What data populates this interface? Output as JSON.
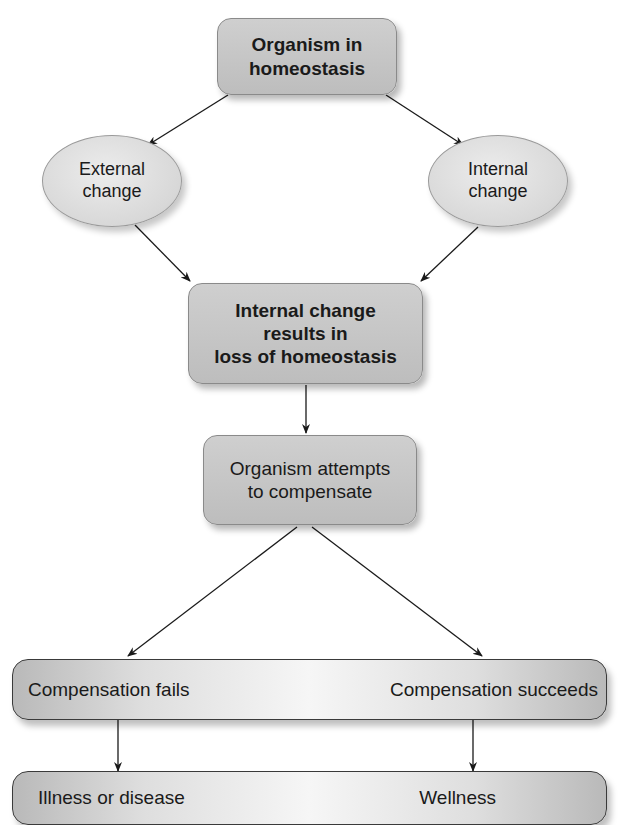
{
  "diagram": {
    "type": "flowchart",
    "nodes": {
      "top": {
        "label_line1": "Organism in",
        "label_line2": "homeostasis"
      },
      "external": {
        "label_line1": "External",
        "label_line2": "change"
      },
      "internal": {
        "label_line1": "Internal",
        "label_line2": "change"
      },
      "loss": {
        "label_line1": "Internal change",
        "label_line2": "results in",
        "label_line3": "loss of homeostasis"
      },
      "compensate": {
        "label_line1": "Organism attempts",
        "label_line2": "to compensate"
      },
      "outcome_bar": {
        "left": "Compensation fails",
        "right": "Compensation succeeds"
      },
      "result_bar": {
        "left": "Illness or disease",
        "right": "Wellness"
      }
    },
    "edges": [
      {
        "from": "Organism in homeostasis",
        "to": "External change"
      },
      {
        "from": "Organism in homeostasis",
        "to": "Internal change"
      },
      {
        "from": "External change",
        "to": "Internal change results in loss of homeostasis"
      },
      {
        "from": "Internal change",
        "to": "Internal change results in loss of homeostasis"
      },
      {
        "from": "Internal change results in loss of homeostasis",
        "to": "Organism attempts to compensate"
      },
      {
        "from": "Organism attempts to compensate",
        "to": "Compensation fails"
      },
      {
        "from": "Organism attempts to compensate",
        "to": "Compensation succeeds"
      },
      {
        "from": "Compensation fails",
        "to": "Illness or disease"
      },
      {
        "from": "Compensation succeeds",
        "to": "Wellness"
      }
    ],
    "colors": {
      "box_fill": "#c4c4c4",
      "ellipse_fill": "#dcdcdc",
      "arrow": "#1a1a1a",
      "bar_border": "#3a3a3a"
    }
  }
}
